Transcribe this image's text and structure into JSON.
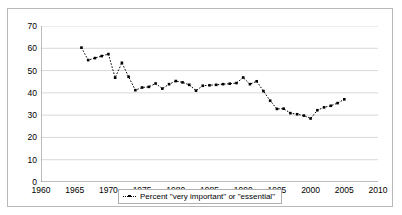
{
  "chart_data": {
    "type": "line",
    "title": "",
    "xlabel": "",
    "ylabel": "",
    "xlim": [
      1960,
      2010
    ],
    "ylim": [
      0,
      70
    ],
    "ytick_step": 10,
    "xtick_step": 5,
    "x_minor_tick_step": 1,
    "grid": true,
    "grid_axis": "y",
    "legend_position": "bottom-center",
    "marker": "square",
    "line_style": "dotted",
    "series_color": "#000000",
    "y_ticks": [
      0,
      10,
      20,
      30,
      40,
      50,
      60,
      70
    ],
    "x_ticks": [
      1960,
      1965,
      1970,
      1975,
      1980,
      1985,
      1990,
      1995,
      2000,
      2005,
      2010
    ],
    "series": [
      {
        "name": "Percent \"very important\" or \"essential\"",
        "x": [
          1966,
          1967,
          1968,
          1969,
          1970,
          1971,
          1972,
          1973,
          1974,
          1975,
          1976,
          1977,
          1978,
          1979,
          1980,
          1981,
          1982,
          1983,
          1984,
          1985,
          1986,
          1987,
          1988,
          1989,
          1990,
          1991,
          1992,
          1993,
          1994,
          1995,
          1996,
          1997,
          1998,
          1999,
          2000,
          2001,
          2002,
          2003,
          2004,
          2005
        ],
        "values": [
          60.3,
          54.7,
          55.6,
          56.5,
          57.4,
          46.8,
          53.5,
          47.2,
          41.2,
          42.4,
          42.7,
          44.2,
          41.9,
          43.9,
          45.3,
          44.7,
          43.6,
          41.0,
          43.2,
          43.4,
          43.6,
          43.9,
          44.1,
          44.4,
          46.9,
          43.9,
          45.2,
          40.8,
          36.5,
          32.8,
          32.9,
          30.9,
          30.4,
          29.8,
          28.5,
          32.2,
          33.5,
          34.2,
          35.4,
          37.1
        ]
      }
    ]
  },
  "legend": {
    "entry_label": "Percent \"very important\" or \"essential\"",
    "marker_icon": "dotted-line-square-marker-icon"
  }
}
